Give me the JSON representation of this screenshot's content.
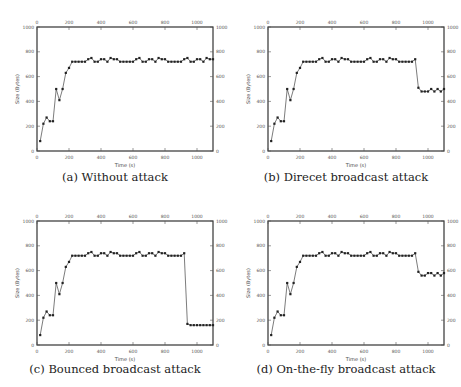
{
  "figure": {
    "captions": [
      "(a) Without attack",
      "(b) Direcet broadcast attack",
      "(c) Bounced broadcast attack",
      "(d) On-the-fly broadcast attack"
    ]
  },
  "chart_data": [
    {
      "type": "line",
      "title": "(a) Without attack",
      "xlabel": "Time (s)",
      "ylabel": "Size (Bytes)",
      "xlim": [
        0,
        1100
      ],
      "ylim": [
        0,
        1000
      ],
      "xticks": [
        0,
        200,
        400,
        600,
        800,
        1000
      ],
      "yticks": [
        0,
        200,
        400,
        600,
        800,
        1000
      ],
      "grid": false,
      "marker": "square",
      "x": [
        20,
        40,
        60,
        80,
        100,
        120,
        140,
        160,
        180,
        200,
        220,
        240,
        260,
        280,
        300,
        320,
        340,
        360,
        380,
        400,
        420,
        440,
        460,
        480,
        500,
        520,
        540,
        560,
        580,
        600,
        620,
        640,
        660,
        680,
        700,
        720,
        740,
        760,
        780,
        800,
        820,
        840,
        860,
        880,
        900,
        920,
        940,
        960,
        980,
        1000,
        1020,
        1040,
        1060,
        1080,
        1100
      ],
      "values": [
        80,
        220,
        270,
        240,
        240,
        500,
        410,
        500,
        630,
        670,
        720,
        720,
        720,
        720,
        720,
        740,
        750,
        720,
        720,
        740,
        740,
        720,
        750,
        740,
        740,
        720,
        720,
        720,
        720,
        720,
        740,
        750,
        720,
        720,
        740,
        740,
        720,
        750,
        740,
        740,
        720,
        720,
        720,
        720,
        720,
        740,
        750,
        720,
        720,
        740,
        740,
        720,
        750,
        740,
        740
      ]
    },
    {
      "type": "line",
      "title": "(b) Direcet broadcast attack",
      "xlabel": "Time (s)",
      "ylabel": "Size (Bytes)",
      "xlim": [
        0,
        1100
      ],
      "ylim": [
        0,
        1000
      ],
      "xticks": [
        0,
        200,
        400,
        600,
        800,
        1000
      ],
      "yticks": [
        0,
        200,
        400,
        600,
        800,
        1000
      ],
      "grid": false,
      "marker": "square",
      "x": [
        20,
        40,
        60,
        80,
        100,
        120,
        140,
        160,
        180,
        200,
        220,
        240,
        260,
        280,
        300,
        320,
        340,
        360,
        380,
        400,
        420,
        440,
        460,
        480,
        500,
        520,
        540,
        560,
        580,
        600,
        620,
        640,
        660,
        680,
        700,
        720,
        740,
        760,
        780,
        800,
        820,
        840,
        860,
        880,
        900,
        920,
        940,
        960,
        980,
        1000,
        1020,
        1040,
        1060,
        1080,
        1100
      ],
      "values": [
        80,
        220,
        270,
        240,
        240,
        500,
        410,
        500,
        630,
        670,
        720,
        720,
        720,
        720,
        720,
        740,
        750,
        720,
        720,
        740,
        740,
        720,
        750,
        740,
        740,
        720,
        720,
        720,
        720,
        720,
        740,
        750,
        720,
        720,
        740,
        740,
        720,
        750,
        740,
        740,
        720,
        720,
        720,
        720,
        720,
        740,
        510,
        480,
        480,
        480,
        500,
        480,
        500,
        480,
        500
      ]
    },
    {
      "type": "line",
      "title": "(c) Bounced broadcast attack",
      "xlabel": "Time (s)",
      "ylabel": "Size (Bytes)",
      "xlim": [
        0,
        1100
      ],
      "ylim": [
        0,
        1000
      ],
      "xticks": [
        0,
        200,
        400,
        600,
        800,
        1000
      ],
      "yticks": [
        0,
        200,
        400,
        600,
        800,
        1000
      ],
      "grid": false,
      "marker": "square",
      "x": [
        20,
        40,
        60,
        80,
        100,
        120,
        140,
        160,
        180,
        200,
        220,
        240,
        260,
        280,
        300,
        320,
        340,
        360,
        380,
        400,
        420,
        440,
        460,
        480,
        500,
        520,
        540,
        560,
        580,
        600,
        620,
        640,
        660,
        680,
        700,
        720,
        740,
        760,
        780,
        800,
        820,
        840,
        860,
        880,
        900,
        920,
        940,
        960,
        980,
        1000,
        1020,
        1040,
        1060,
        1080,
        1100
      ],
      "values": [
        80,
        220,
        270,
        240,
        240,
        500,
        410,
        500,
        630,
        670,
        720,
        720,
        720,
        720,
        720,
        740,
        750,
        720,
        720,
        740,
        740,
        720,
        750,
        740,
        740,
        720,
        720,
        720,
        720,
        720,
        740,
        750,
        720,
        720,
        740,
        740,
        720,
        750,
        740,
        740,
        720,
        720,
        720,
        720,
        720,
        740,
        170,
        160,
        160,
        160,
        160,
        160,
        160,
        160,
        160
      ]
    },
    {
      "type": "line",
      "title": "(d) On-the-fly broadcast attack",
      "xlabel": "Time (s)",
      "ylabel": "Size (Bytes)",
      "xlim": [
        0,
        1100
      ],
      "ylim": [
        0,
        1000
      ],
      "xticks": [
        0,
        200,
        400,
        600,
        800,
        1000
      ],
      "yticks": [
        0,
        200,
        400,
        600,
        800,
        1000
      ],
      "grid": false,
      "marker": "square",
      "x": [
        20,
        40,
        60,
        80,
        100,
        120,
        140,
        160,
        180,
        200,
        220,
        240,
        260,
        280,
        300,
        320,
        340,
        360,
        380,
        400,
        420,
        440,
        460,
        480,
        500,
        520,
        540,
        560,
        580,
        600,
        620,
        640,
        660,
        680,
        700,
        720,
        740,
        760,
        780,
        800,
        820,
        840,
        860,
        880,
        900,
        920,
        940,
        960,
        980,
        1000,
        1020,
        1040,
        1060,
        1080,
        1100
      ],
      "values": [
        80,
        220,
        270,
        240,
        240,
        500,
        410,
        500,
        630,
        670,
        720,
        720,
        720,
        720,
        720,
        740,
        750,
        720,
        720,
        740,
        740,
        720,
        750,
        740,
        740,
        720,
        720,
        720,
        720,
        720,
        740,
        750,
        720,
        720,
        740,
        740,
        720,
        750,
        740,
        740,
        720,
        720,
        720,
        720,
        720,
        740,
        590,
        560,
        560,
        580,
        580,
        560,
        580,
        560,
        580
      ]
    }
  ]
}
